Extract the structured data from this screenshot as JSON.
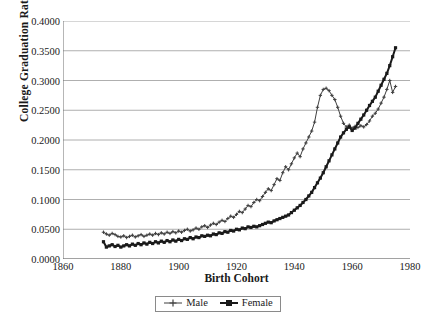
{
  "chart_data": {
    "type": "line",
    "title": "",
    "xlabel": "Birth Cohort",
    "ylabel": "College Graduation Rates",
    "xlim": [
      1860,
      1980
    ],
    "ylim": [
      0.0,
      0.4
    ],
    "grid": "horizontal",
    "legend_position": "bottom",
    "xticks": [
      "1860",
      "1880",
      "1900",
      "1920",
      "1940",
      "1960",
      "1980"
    ],
    "xtick_values": [
      1860,
      1880,
      1900,
      1920,
      1940,
      1960,
      1980
    ],
    "yticks": [
      "0.0000",
      "0.0500",
      "0.1000",
      "0.1500",
      "0.2000",
      "0.2500",
      "0.3000",
      "0.3500",
      "0.4000"
    ],
    "ytick_values": [
      0.0,
      0.05,
      0.1,
      0.15,
      0.2,
      0.25,
      0.3,
      0.35,
      0.4
    ],
    "x": [
      1874,
      1875,
      1876,
      1877,
      1878,
      1879,
      1880,
      1881,
      1882,
      1883,
      1884,
      1885,
      1886,
      1887,
      1888,
      1889,
      1890,
      1891,
      1892,
      1893,
      1894,
      1895,
      1896,
      1897,
      1898,
      1899,
      1900,
      1901,
      1902,
      1903,
      1904,
      1905,
      1906,
      1907,
      1908,
      1909,
      1910,
      1911,
      1912,
      1913,
      1914,
      1915,
      1916,
      1917,
      1918,
      1919,
      1920,
      1921,
      1922,
      1923,
      1924,
      1925,
      1926,
      1927,
      1928,
      1929,
      1930,
      1931,
      1932,
      1933,
      1934,
      1935,
      1936,
      1937,
      1938,
      1939,
      1940,
      1941,
      1942,
      1943,
      1944,
      1945,
      1946,
      1947,
      1948,
      1949,
      1950,
      1951,
      1952,
      1953,
      1954,
      1955,
      1956,
      1957,
      1958,
      1959,
      1960,
      1961,
      1962,
      1963,
      1964,
      1965,
      1966,
      1967,
      1968,
      1969,
      1970,
      1971,
      1972,
      1973,
      1974,
      1975
    ],
    "series": [
      {
        "name": "Male",
        "marker": "cross",
        "color": "#3f3f3f",
        "line_width": 1,
        "values": [
          0.045,
          0.042,
          0.04,
          0.043,
          0.041,
          0.038,
          0.037,
          0.039,
          0.036,
          0.038,
          0.04,
          0.037,
          0.039,
          0.041,
          0.038,
          0.04,
          0.042,
          0.04,
          0.043,
          0.041,
          0.044,
          0.042,
          0.045,
          0.043,
          0.046,
          0.044,
          0.047,
          0.045,
          0.048,
          0.05,
          0.047,
          0.049,
          0.052,
          0.05,
          0.054,
          0.056,
          0.053,
          0.057,
          0.06,
          0.058,
          0.062,
          0.065,
          0.063,
          0.068,
          0.072,
          0.07,
          0.075,
          0.08,
          0.078,
          0.084,
          0.09,
          0.088,
          0.095,
          0.1,
          0.098,
          0.105,
          0.112,
          0.118,
          0.115,
          0.125,
          0.135,
          0.132,
          0.145,
          0.155,
          0.15,
          0.16,
          0.17,
          0.178,
          0.172,
          0.185,
          0.195,
          0.205,
          0.215,
          0.23,
          0.255,
          0.275,
          0.285,
          0.287,
          0.283,
          0.275,
          0.268,
          0.255,
          0.24,
          0.228,
          0.222,
          0.225,
          0.22,
          0.223,
          0.221,
          0.224,
          0.222,
          0.226,
          0.232,
          0.24,
          0.245,
          0.252,
          0.262,
          0.272,
          0.285,
          0.3,
          0.28,
          0.29
        ]
      },
      {
        "name": "Female",
        "marker": "square",
        "color": "#1a1a1a",
        "line_width": 2,
        "values": [
          0.029,
          0.02,
          0.022,
          0.024,
          0.021,
          0.023,
          0.02,
          0.022,
          0.024,
          0.022,
          0.025,
          0.023,
          0.026,
          0.024,
          0.027,
          0.025,
          0.028,
          0.026,
          0.029,
          0.027,
          0.03,
          0.028,
          0.031,
          0.029,
          0.032,
          0.03,
          0.033,
          0.031,
          0.034,
          0.033,
          0.036,
          0.034,
          0.037,
          0.036,
          0.039,
          0.038,
          0.04,
          0.039,
          0.042,
          0.041,
          0.044,
          0.043,
          0.046,
          0.045,
          0.048,
          0.047,
          0.05,
          0.049,
          0.052,
          0.051,
          0.054,
          0.053,
          0.055,
          0.054,
          0.056,
          0.058,
          0.06,
          0.062,
          0.061,
          0.064,
          0.066,
          0.068,
          0.07,
          0.072,
          0.074,
          0.078,
          0.082,
          0.086,
          0.09,
          0.095,
          0.1,
          0.106,
          0.112,
          0.12,
          0.128,
          0.136,
          0.145,
          0.155,
          0.165,
          0.175,
          0.185,
          0.195,
          0.205,
          0.212,
          0.218,
          0.222,
          0.216,
          0.22,
          0.228,
          0.235,
          0.242,
          0.25,
          0.258,
          0.265,
          0.272,
          0.282,
          0.292,
          0.302,
          0.312,
          0.325,
          0.34,
          0.355
        ]
      }
    ]
  },
  "legend": {
    "items": [
      {
        "label": "Male"
      },
      {
        "label": "Female"
      }
    ]
  },
  "colors": {
    "gridline": "#9a9a9a",
    "axis": "#6e6e6e",
    "text": "#1a1a1a",
    "background": "#ffffff"
  }
}
